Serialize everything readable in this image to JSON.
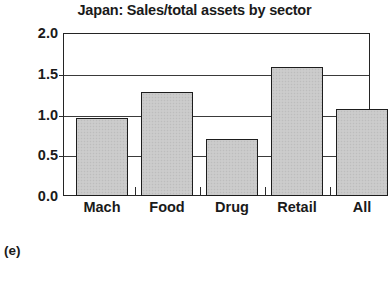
{
  "chart_data": {
    "type": "bar",
    "title": "Japan: Sales/total assets by sector",
    "xlabel": "",
    "ylabel": "",
    "categories": [
      "Mach",
      "Food",
      "Drug",
      "Retail",
      "All"
    ],
    "values": [
      0.96,
      1.28,
      0.7,
      1.58,
      1.07
    ],
    "series": [
      {
        "name": "Sales/total assets",
        "values": [
          0.96,
          1.28,
          0.7,
          1.58,
          1.07
        ]
      }
    ],
    "ylim": [
      0.0,
      2.0
    ],
    "yticks": [
      0.0,
      0.5,
      1.0,
      1.5,
      2.0
    ],
    "ytick_labels": [
      "0.0",
      "0.5",
      "1.0",
      "1.5",
      "2.0"
    ],
    "grid": true,
    "grid_axis": "y",
    "legend": false,
    "legend_position": "none",
    "bar_fill_color": "#c9c9c9",
    "bar_edge_color": "#1d1d1d",
    "gridline_color": "#3a3a3a",
    "frame_color": "#242424",
    "background_color": "#ffffff",
    "annotations": []
  },
  "panel": {
    "label": "(e)"
  }
}
